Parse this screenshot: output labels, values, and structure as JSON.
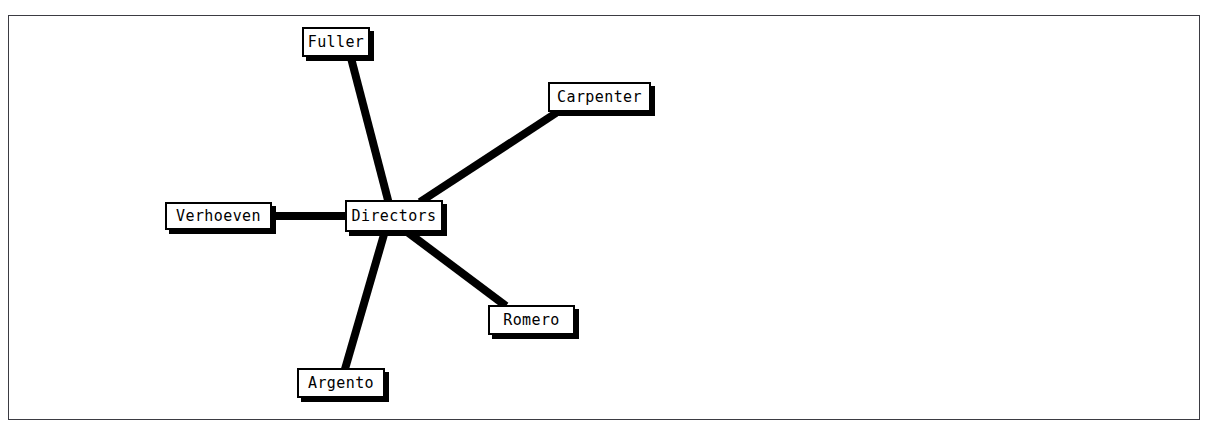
{
  "diagram": {
    "title": "Directors",
    "type": "radial-node-link-graph",
    "canvas": {
      "border_color": "#3b3b42",
      "background": "#ffffff",
      "x": 8,
      "y": 15,
      "width": 1192,
      "height": 405
    },
    "style": {
      "node_fill": "#ffffff",
      "node_stroke": "#000000",
      "node_text": "#000000",
      "edge_color": "#000000",
      "edge_width": 8,
      "shadow_color": "#000000"
    },
    "hub": {
      "id": "directors",
      "label": "Directors",
      "x": 345,
      "y": 200,
      "width": 98,
      "height": 32
    },
    "nodes": [
      {
        "id": "fuller",
        "label": "Fuller",
        "x": 302,
        "y": 27,
        "width": 68,
        "height": 30
      },
      {
        "id": "carpenter",
        "label": "Carpenter",
        "x": 548,
        "y": 82,
        "width": 103,
        "height": 30
      },
      {
        "id": "verhoeven",
        "label": "Verhoeven",
        "x": 165,
        "y": 202,
        "width": 107,
        "height": 28
      },
      {
        "id": "romero",
        "label": "Romero",
        "x": 488,
        "y": 305,
        "width": 87,
        "height": 30
      },
      {
        "id": "argento",
        "label": "Argento",
        "x": 297,
        "y": 368,
        "width": 88,
        "height": 30
      }
    ],
    "edges": [
      {
        "id": "edge-directors-fuller",
        "from": "directors",
        "to": "fuller",
        "x1": 389,
        "y1": 204,
        "x2": 351,
        "y2": 58
      },
      {
        "id": "edge-directors-carpenter",
        "from": "directors",
        "to": "carpenter",
        "x1": 420,
        "y1": 202,
        "x2": 556,
        "y2": 113
      },
      {
        "id": "edge-directors-verhoeven",
        "from": "directors",
        "to": "verhoeven",
        "x1": 346,
        "y1": 216,
        "x2": 270,
        "y2": 216
      },
      {
        "id": "edge-directors-romero",
        "from": "directors",
        "to": "romero",
        "x1": 406,
        "y1": 231,
        "x2": 506,
        "y2": 306
      },
      {
        "id": "edge-directors-argento",
        "from": "directors",
        "to": "argento",
        "x1": 385,
        "y1": 231,
        "x2": 345,
        "y2": 369
      }
    ]
  }
}
